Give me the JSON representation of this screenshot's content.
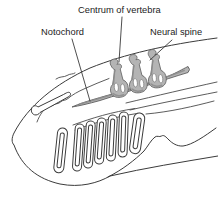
{
  "diagram": {
    "labels": {
      "centrum": "Centrum of vertebra",
      "notochord": "Notochord",
      "neural_spine": "Neural spine"
    },
    "colors": {
      "background": "#ffffff",
      "line_ink": "#3b3b3b",
      "cartilage_fill": "#b4b4b4",
      "cartilage_shade": "#8c8c8c",
      "text": "#1c1c1c"
    }
  }
}
